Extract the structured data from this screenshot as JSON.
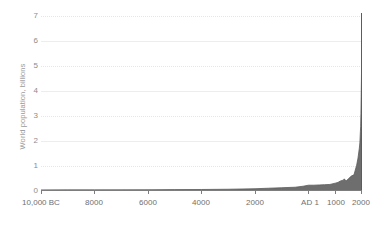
{
  "chart_data": {
    "type": "area",
    "title": "",
    "xlabel": "",
    "ylabel": "World population, billions",
    "ylim": [
      0,
      7
    ],
    "xlim": [
      -10000,
      2000
    ],
    "grid": true,
    "legend": "none",
    "fill_color": "#6e6e6e",
    "line_color": "#5c5c5c",
    "axis_color": "#7d7d7d",
    "gridline_color": "#ededed",
    "ytick_labels": [
      "7",
      "6",
      "5",
      "4",
      "3",
      "2",
      "1",
      "0"
    ],
    "ytick_values": [
      7,
      6,
      5,
      4,
      3,
      2,
      1,
      0
    ],
    "xtick_labels": [
      "10,000 BC",
      "8000",
      "6000",
      "4000",
      "2000",
      "AD 1",
      "1000",
      "2000"
    ],
    "xtick_values": [
      -10000,
      -8000,
      -6000,
      -4000,
      -2000,
      1,
      1000,
      2000
    ],
    "x": [
      -10000,
      -9000,
      -8000,
      -7000,
      -6000,
      -5000,
      -4000,
      -3000,
      -2000,
      -1500,
      -1000,
      -500,
      -200,
      1,
      200,
      400,
      600,
      800,
      1000,
      1100,
      1200,
      1300,
      1340,
      1400,
      1500,
      1600,
      1700,
      1750,
      1800,
      1850,
      1900,
      1920,
      1940,
      1950,
      1960,
      1970,
      1980,
      1990,
      2000,
      2010
    ],
    "values": [
      0.004,
      0.005,
      0.005,
      0.007,
      0.01,
      0.015,
      0.02,
      0.03,
      0.05,
      0.07,
      0.09,
      0.11,
      0.15,
      0.19,
      0.19,
      0.2,
      0.21,
      0.22,
      0.27,
      0.3,
      0.36,
      0.39,
      0.44,
      0.35,
      0.45,
      0.55,
      0.6,
      0.79,
      0.98,
      1.26,
      1.65,
      1.86,
      2.3,
      2.52,
      3.02,
      3.7,
      4.44,
      5.32,
      6.14,
      6.96
    ]
  }
}
